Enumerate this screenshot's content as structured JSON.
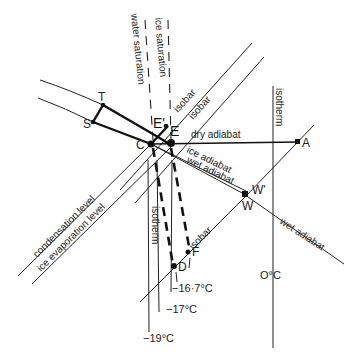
{
  "diagram": {
    "lines": {
      "water_saturation": "water saturation",
      "ice_saturation": "ice saturation",
      "isobar_1": "isobar",
      "isobar_2": "isobar",
      "isobar_lower": "isobar",
      "isotherm_right": "isotherm",
      "isotherm_left": "isotherm",
      "dry_adiabat": "dry adiabat",
      "ice_adiabat": "ice adiabat",
      "wet_adiabat_1": "wet adiabat",
      "wet_adiabat_2": "wet adiabat",
      "condensation_level": "condensation level",
      "ice_evaporation_level": "ice evaporation level"
    },
    "points": {
      "T": "T",
      "S": "S",
      "C": "C",
      "E": "E",
      "E_prime": "E'",
      "A": "A",
      "W": "W",
      "W_prime": "W'",
      "D": "D",
      "F": "F"
    },
    "temperatures": {
      "t1": "−16·7°C",
      "t2": "−17°C",
      "t3": "−19°C",
      "t4": "O°C"
    }
  }
}
